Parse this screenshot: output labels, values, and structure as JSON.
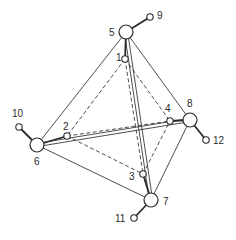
{
  "diagram": {
    "title": "",
    "nodes": [
      {
        "id": "1",
        "label": "1",
        "size": "small",
        "x": 125,
        "y": 59,
        "lx": 116,
        "ly": 61
      },
      {
        "id": "2",
        "label": "2",
        "size": "small",
        "x": 67,
        "y": 136,
        "lx": 63,
        "ly": 130
      },
      {
        "id": "3",
        "label": "3",
        "size": "small",
        "x": 143,
        "y": 174,
        "lx": 129,
        "ly": 180
      },
      {
        "id": "4",
        "label": "4",
        "size": "small",
        "x": 170,
        "y": 121,
        "lx": 165,
        "ly": 112
      },
      {
        "id": "5",
        "label": "5",
        "size": "large",
        "x": 126,
        "y": 32,
        "lx": 109,
        "ly": 36
      },
      {
        "id": "6",
        "label": "6",
        "size": "large",
        "x": 37,
        "y": 145,
        "lx": 34,
        "ly": 165
      },
      {
        "id": "7",
        "label": "7",
        "size": "large",
        "x": 151,
        "y": 200,
        "lx": 163,
        "ly": 205
      },
      {
        "id": "8",
        "label": "8",
        "size": "large",
        "x": 190,
        "y": 120,
        "lx": 187,
        "ly": 107
      },
      {
        "id": "9",
        "label": "9",
        "size": "small",
        "x": 150,
        "y": 17,
        "lx": 157,
        "ly": 19
      },
      {
        "id": "10",
        "label": "10",
        "size": "small",
        "x": 19,
        "y": 127,
        "lx": 12,
        "ly": 117
      },
      {
        "id": "11",
        "label": "11",
        "size": "small",
        "x": 134,
        "y": 218,
        "lx": 115,
        "ly": 222
      },
      {
        "id": "12",
        "label": "12",
        "size": "small",
        "x": 206,
        "y": 140,
        "lx": 213,
        "ly": 144
      }
    ],
    "solid_edges": [
      [
        "5",
        "6"
      ],
      [
        "5",
        "8"
      ],
      [
        "5",
        "7"
      ],
      [
        "6",
        "8"
      ],
      [
        "6",
        "7"
      ],
      [
        "8",
        "7"
      ]
    ],
    "dashed_edges": [
      [
        "1",
        "2"
      ],
      [
        "1",
        "4"
      ],
      [
        "1",
        "3"
      ],
      [
        "2",
        "4"
      ],
      [
        "2",
        "3"
      ],
      [
        "3",
        "4"
      ]
    ],
    "bonds": [
      [
        "5",
        "9"
      ],
      [
        "6",
        "10"
      ],
      [
        "7",
        "11"
      ],
      [
        "8",
        "12"
      ],
      [
        "5",
        "1"
      ],
      [
        "6",
        "2"
      ],
      [
        "7",
        "3"
      ],
      [
        "8",
        "4"
      ]
    ],
    "double_edges": [
      [
        "5",
        "7"
      ],
      [
        "6",
        "8"
      ]
    ]
  }
}
